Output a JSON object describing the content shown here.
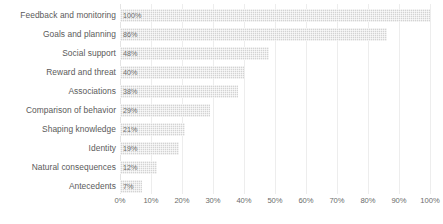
{
  "chart_data": {
    "type": "bar",
    "orientation": "horizontal",
    "title": "",
    "xlabel": "",
    "ylabel": "",
    "xlim": [
      0,
      100
    ],
    "grid": true,
    "legend": null,
    "bar_color": "#d3d3d3",
    "categories": [
      "Feedback and monitoring",
      "Goals and planning",
      "Social support",
      "Reward and threat",
      "Associations",
      "Comparison of behavior",
      "Shaping knowledge",
      "Identity",
      "Natural consequences",
      "Antecedents"
    ],
    "values": [
      100,
      86,
      48,
      40,
      38,
      29,
      21,
      19,
      12,
      7
    ],
    "data_labels": [
      "100%",
      "86%",
      "48%",
      "40%",
      "38%",
      "29%",
      "21%",
      "19%",
      "12%",
      "7%"
    ],
    "xticks": [
      0,
      10,
      20,
      30,
      40,
      50,
      60,
      70,
      80,
      90,
      100
    ],
    "xticklabels": [
      "0%",
      "10%",
      "20%",
      "30%",
      "40%",
      "50%",
      "60%",
      "70%",
      "80%",
      "90%",
      "100%"
    ]
  }
}
